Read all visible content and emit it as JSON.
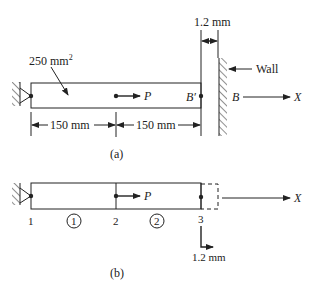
{
  "figure_a": {
    "label": "(a)",
    "area_label": "250 mm",
    "area_exp": "2",
    "load_label": "P",
    "end_label": "B′",
    "wall_point_label": "B",
    "wall_label": "Wall",
    "axis_label": "X",
    "gap_label": "1.2 mm",
    "dim_left": "150 mm",
    "dim_right": "150 mm"
  },
  "figure_b": {
    "label": "(b)",
    "load_label": "P",
    "axis_label": "X",
    "nodes": [
      "1",
      "2",
      "3"
    ],
    "elements": [
      "1",
      "2"
    ],
    "displacement_label": "1.2 mm"
  },
  "colors": {
    "line": "#222222",
    "background": "#ffffff"
  }
}
